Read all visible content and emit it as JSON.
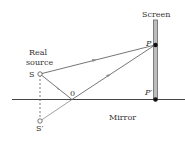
{
  "labels": {
    "screen": "Screen",
    "real": "Real",
    "source": "source",
    "s": "S",
    "o": "0",
    "p": "P",
    "p_prime": "P′",
    "mirror": "Mirror",
    "s_prime": "S′"
  },
  "colors": {
    "line": "#555555",
    "screen_fill": "#b8b8b8",
    "point": "#111111"
  }
}
